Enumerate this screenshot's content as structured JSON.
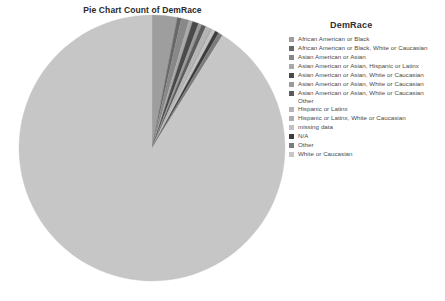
{
  "chart_data": {
    "type": "pie",
    "title": "Pie Chart Count of DemRace",
    "legend_title": "DemRace",
    "legend_position": "right",
    "xlabel": "",
    "ylabel": "",
    "start_angle_deg": -90,
    "direction": "clockwise",
    "categories": [
      "African American or Black",
      "African American or Black, White or Caucasian",
      "Asian American or Asian",
      "Asian American or Asian, Hispanic or Latinx",
      "Asian American or Asian, White or Caucasian",
      "Asian American or Asian, White or Caucasian",
      "Asian American or Asian, White or Caucasian Other",
      "Hispanic or Latinx",
      "Hispanic or Latinx, White or Caucasian",
      "missing data",
      "N/A",
      "Other",
      "White or Caucasian"
    ],
    "values": [
      3.05,
      0.5,
      0.95,
      0.45,
      0.75,
      0.4,
      0.55,
      0.45,
      0.4,
      0.4,
      0.45,
      0.55,
      91.1
    ],
    "colors": [
      "#9e9e9e",
      "#686868",
      "#888888",
      "#a9a9a9",
      "#4a4a4a",
      "#9a9a9a",
      "#5c5c5c",
      "#b4b4b4",
      "#aeaeae",
      "#c2c2c2",
      "#3c3c3c",
      "#7c7c7c",
      "#c6c6c6"
    ]
  },
  "legend": {
    "title": "DemRace",
    "items": [
      {
        "label": "African American or Black",
        "color": "#9e9e9e"
      },
      {
        "label": "African American or Black, White or Caucasian",
        "color": "#686868"
      },
      {
        "label": "Asian American or Asian",
        "color": "#888888"
      },
      {
        "label": "Asian American or Asian, Hispanic or Latinx",
        "color": "#a9a9a9"
      },
      {
        "label": "Asian American or Asian, White or Caucasian",
        "color": "#4a4a4a"
      },
      {
        "label": "Asian American or Asian, White or Caucasian",
        "color": "#9a9a9a"
      },
      {
        "label": "Asian American or Asian, White or Caucasian Other",
        "color": "#5c5c5c"
      },
      {
        "label": "Hispanic or Latinx",
        "color": "#b4b4b4"
      },
      {
        "label": "Hispanic or Latinx, White or Caucasian",
        "color": "#aeaeae"
      },
      {
        "label": "missing data",
        "color": "#c2c2c2"
      },
      {
        "label": "N/A",
        "color": "#3c3c3c"
      },
      {
        "label": "Other",
        "color": "#7c7c7c"
      },
      {
        "label": "White or Caucasian",
        "color": "#c6c6c6"
      }
    ]
  },
  "geometry": {
    "cx": 152,
    "cy": 134,
    "r": 133
  }
}
